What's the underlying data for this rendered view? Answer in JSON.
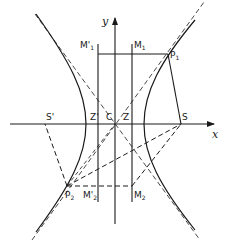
{
  "diagram": {
    "type": "hyperbola-focus-directrix",
    "axes": {
      "x_label": "x",
      "y_label": "y"
    },
    "points": {
      "center": "C",
      "focus_right": "S",
      "focus_left": "S'",
      "point_upper": "P",
      "point_upper_sub": "1",
      "point_lower": "P",
      "point_lower_sub": "2"
    },
    "directrix_labels": {
      "right_foot": "Z",
      "left_foot": "Z'",
      "m1": "M",
      "m1_sub": "1",
      "m1_prime": "M'",
      "m1_prime_sub": "1",
      "m2": "M",
      "m2_sub": "2",
      "m2_prime": "M'",
      "m2_prime_sub": "2"
    },
    "colors": {
      "line": "#1a1a1a",
      "background": "#ffffff"
    }
  }
}
